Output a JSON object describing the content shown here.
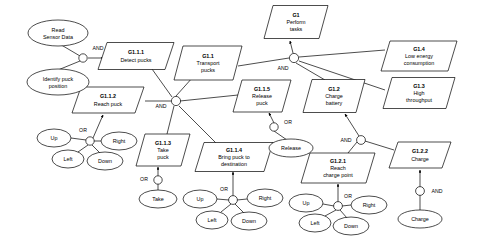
{
  "diagram": {
    "type": "goal-model",
    "colors": {
      "background": "#ffffff",
      "stroke": "#000000",
      "fill": "#ffffff"
    },
    "goals": [
      {
        "id": "G1",
        "code": "G1",
        "label_line1": "Perform",
        "label_line2": "tasks",
        "label_line3": "",
        "cx": 296,
        "cy": 22,
        "w": 64,
        "h": 33
      },
      {
        "id": "G1.1.1",
        "code": "G1.1.1",
        "label_line1": "Detect pucks",
        "label_line2": "",
        "label_line3": "",
        "cx": 136,
        "cy": 56,
        "w": 76,
        "h": 27
      },
      {
        "id": "G1.1",
        "code": "G1.1",
        "label_line1": "Transport",
        "label_line2": "pucks",
        "label_line3": "",
        "cx": 208,
        "cy": 63,
        "w": 68,
        "h": 34
      },
      {
        "id": "G1.4",
        "code": "G1.4",
        "label_line1": "Low energy",
        "label_line2": "consumption",
        "label_line3": "",
        "cx": 419,
        "cy": 56,
        "w": 76,
        "h": 30
      },
      {
        "id": "G1.3",
        "code": "G1.3",
        "label_line1": "High",
        "label_line2": "throughput",
        "label_line3": "",
        "cx": 419,
        "cy": 93,
        "w": 72,
        "h": 31
      },
      {
        "id": "G1.1.2",
        "code": "G1.1.2",
        "label_line1": "Reach puck",
        "label_line2": "",
        "label_line3": "",
        "cx": 108,
        "cy": 100,
        "w": 72,
        "h": 26
      },
      {
        "id": "G1.1.5",
        "code": "G1.1.5",
        "label_line1": "Release",
        "label_line2": "puck",
        "label_line3": "",
        "cx": 262,
        "cy": 96,
        "w": 58,
        "h": 32
      },
      {
        "id": "G1.2",
        "code": "G1.2",
        "label_line1": "Charge",
        "label_line2": "battery",
        "label_line3": "",
        "cx": 334,
        "cy": 96,
        "w": 62,
        "h": 33
      },
      {
        "id": "G1.1.3",
        "code": "G1.1.3",
        "label_line1": "Take",
        "label_line2": "puck",
        "label_line3": "",
        "cx": 163,
        "cy": 150,
        "w": 54,
        "h": 32
      },
      {
        "id": "G1.1.4",
        "code": "G1.1.4",
        "label_line1": "Bring puck to",
        "label_line2": "destination",
        "label_line3": "",
        "cx": 234,
        "cy": 157,
        "w": 78,
        "h": 29
      },
      {
        "id": "G1.2.1",
        "code": "G1.2.1",
        "label_line1": "Reach",
        "label_line2": "charge point",
        "label_line3": "",
        "cx": 338,
        "cy": 168,
        "w": 74,
        "h": 30
      },
      {
        "id": "G1.2.2",
        "code": "G1.2.2",
        "label_line1": "Charge",
        "label_line2": "",
        "label_line3": "",
        "cx": 420,
        "cy": 155,
        "w": 62,
        "h": 26
      }
    ],
    "tasks": [
      {
        "id": "read-sensor-data",
        "label_line1": "Read",
        "label_line2": "Sensor Data",
        "cx": 58,
        "cy": 33,
        "rx": 30,
        "ry": 13
      },
      {
        "id": "identify-puck",
        "label_line1": "Identify puck",
        "label_line2": "position",
        "cx": 58,
        "cy": 82,
        "rx": 31,
        "ry": 13
      },
      {
        "id": "take",
        "label_line1": "Take",
        "label_line2": "",
        "cx": 158,
        "cy": 199,
        "rx": 19,
        "ry": 9
      },
      {
        "id": "release",
        "label_line1": "Release",
        "label_line2": "",
        "cx": 291,
        "cy": 148,
        "rx": 22,
        "ry": 9
      },
      {
        "id": "charge",
        "label_line1": "Charge",
        "label_line2": "",
        "cx": 420,
        "cy": 219,
        "rx": 22,
        "ry": 9
      },
      {
        "id": "up-1",
        "label_line1": "Up",
        "label_line2": "",
        "cx": 54,
        "cy": 138,
        "rx": 17,
        "ry": 9
      },
      {
        "id": "left-1",
        "label_line1": "Left",
        "label_line2": "",
        "cx": 68,
        "cy": 159,
        "rx": 16,
        "ry": 9
      },
      {
        "id": "right-1",
        "label_line1": "Right",
        "label_line2": "",
        "cx": 119,
        "cy": 141,
        "rx": 18,
        "ry": 9
      },
      {
        "id": "down-1",
        "label_line1": "Down",
        "label_line2": "",
        "cx": 105,
        "cy": 161,
        "rx": 18,
        "ry": 9
      },
      {
        "id": "up-2",
        "label_line1": "Up",
        "label_line2": "",
        "cx": 200,
        "cy": 199,
        "rx": 17,
        "ry": 9
      },
      {
        "id": "left-2",
        "label_line1": "Left",
        "label_line2": "",
        "cx": 212,
        "cy": 220,
        "rx": 16,
        "ry": 9
      },
      {
        "id": "right-2",
        "label_line1": "Right",
        "label_line2": "",
        "cx": 265,
        "cy": 198,
        "rx": 18,
        "ry": 9
      },
      {
        "id": "down-2",
        "label_line1": "Down",
        "label_line2": "",
        "cx": 249,
        "cy": 221,
        "rx": 18,
        "ry": 9
      },
      {
        "id": "up-3",
        "label_line1": "Up",
        "label_line2": "",
        "cx": 306,
        "cy": 203,
        "rx": 17,
        "ry": 9
      },
      {
        "id": "left-3",
        "label_line1": "Left",
        "label_line2": "",
        "cx": 315,
        "cy": 223,
        "rx": 16,
        "ry": 9
      },
      {
        "id": "right-3",
        "label_line1": "Right",
        "label_line2": "",
        "cx": 369,
        "cy": 205,
        "rx": 18,
        "ry": 9
      },
      {
        "id": "down-3",
        "label_line1": "Down",
        "label_line2": "",
        "cx": 351,
        "cy": 226,
        "rx": 18,
        "ry": 9
      }
    ],
    "operators": [
      {
        "id": "and-root",
        "type": "AND",
        "label": "AND",
        "cx": 83,
        "cy": 58,
        "r": 4.2,
        "lx": 98,
        "ly": 50
      },
      {
        "id": "and-g1",
        "type": "AND",
        "label": "AND",
        "cx": 294,
        "cy": 58,
        "r": 4.6,
        "lx": 283,
        "ly": 70
      },
      {
        "id": "and-g11",
        "type": "AND",
        "label": "AND",
        "cx": 176,
        "cy": 101,
        "r": 4.6,
        "lx": 161,
        "ly": 108
      },
      {
        "id": "or-release",
        "type": "OR",
        "label": "OR",
        "cx": 274,
        "cy": 127,
        "r": 4.2,
        "lx": 288,
        "ly": 124
      },
      {
        "id": "and-g12",
        "type": "AND",
        "label": "AND",
        "cx": 361,
        "cy": 140,
        "r": 4.4,
        "lx": 346,
        "ly": 142
      },
      {
        "id": "or-g112",
        "type": "OR",
        "label": "OR",
        "cx": 90,
        "cy": 141,
        "r": 4.2,
        "lx": 83,
        "ly": 132
      },
      {
        "id": "or-take",
        "type": "OR",
        "label": "OR",
        "cx": 158,
        "cy": 180,
        "r": 4.2,
        "lx": 144,
        "ly": 181
      },
      {
        "id": "or-g114",
        "type": "OR",
        "label": "OR",
        "cx": 233,
        "cy": 200,
        "r": 4.4,
        "lx": 224,
        "ly": 191
      },
      {
        "id": "or-g121",
        "type": "OR",
        "label": "OR",
        "cx": 338,
        "cy": 206,
        "r": 4.4,
        "lx": 348,
        "ly": 198
      },
      {
        "id": "and-charge",
        "type": "AND",
        "label": "AND",
        "cx": 420,
        "cy": 191,
        "r": 4.4,
        "lx": 437,
        "ly": 193
      }
    ]
  }
}
